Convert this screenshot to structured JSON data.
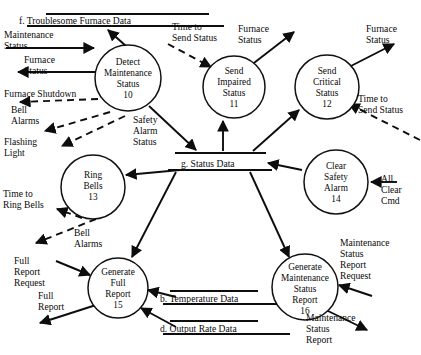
{
  "diagram": {
    "kind": "data-flow-diagram",
    "width": 421,
    "height": 355,
    "background_color": "#ffffff",
    "ink_color": "#0d0d0d",
    "processes": [
      {
        "id": "p10",
        "title_lines": [
          "Detect",
          "Maintenance",
          "Status"
        ],
        "number": "10",
        "cx": 128,
        "cy": 78,
        "r": 33
      },
      {
        "id": "p11",
        "title_lines": [
          "Send",
          "Impaired",
          "Status"
        ],
        "number": "11",
        "cx": 234,
        "cy": 87,
        "r": 31
      },
      {
        "id": "p12",
        "title_lines": [
          "Send",
          "Critical",
          "Status"
        ],
        "number": "12",
        "cx": 327,
        "cy": 87,
        "r": 32
      },
      {
        "id": "p13",
        "title_lines": [
          "Ring",
          "Bells"
        ],
        "number": "13",
        "cx": 93,
        "cy": 187,
        "r": 32
      },
      {
        "id": "p14",
        "title_lines": [
          "Clear",
          "Safety",
          "Alarm"
        ],
        "number": "14",
        "cx": 336,
        "cy": 182,
        "r": 32
      },
      {
        "id": "p15",
        "title_lines": [
          "Generate",
          "Full",
          "Report"
        ],
        "number": "15",
        "cx": 118,
        "cy": 288,
        "r": 30
      },
      {
        "id": "p16",
        "title_lines": [
          "Generate",
          "Maintenance",
          "Status",
          "Report"
        ],
        "number": "16",
        "cx": 305,
        "cy": 287,
        "r": 33
      }
    ],
    "data_stores": [
      {
        "id": "store_f",
        "label": "f.  Troublesome Furnace Data",
        "x1": 46,
        "x2": 209,
        "y_top": 14,
        "y_bottom": 26,
        "text_x": 19,
        "text_y": 24
      },
      {
        "id": "store_g",
        "label": "g.  Status Data",
        "x1": 175,
        "x2": 266,
        "y_top": 153,
        "y_bottom": 170,
        "text_x": 181,
        "text_y": 167
      },
      {
        "id": "store_b",
        "label": "b.  Temperature Data",
        "x1": 163,
        "x2": 268,
        "y_top": 291,
        "y_bottom": 304,
        "text_x": 160,
        "text_y": 302
      },
      {
        "id": "store_d",
        "label": "d.  Output Rate Data",
        "x1": 163,
        "x2": 268,
        "y_top": 321,
        "y_bottom": 334,
        "text_x": 160,
        "text_y": 332
      }
    ],
    "flow_labels": [
      {
        "id": "lbl_maintenance_status_in",
        "lines": [
          "Maintenance",
          "Status"
        ],
        "x": 4,
        "y": 38
      },
      {
        "id": "lbl_furnace_status_out",
        "lines": [
          "Furnace",
          "Status"
        ],
        "x": 24,
        "y": 63
      },
      {
        "id": "lbl_furnace_shutdown",
        "lines": [
          "Furnace Shutdown"
        ],
        "x": 4,
        "y": 97
      },
      {
        "id": "lbl_bell_alarms_left",
        "lines": [
          "Bell",
          "Alarms"
        ],
        "x": 11,
        "y": 110
      },
      {
        "id": "lbl_flashing_light",
        "lines": [
          "Flashing",
          "Light"
        ],
        "x": 4,
        "y": 142
      },
      {
        "id": "lbl_time_to_send_status_11",
        "lines": [
          "Time to",
          "Send Status"
        ],
        "x": 172,
        "y": 30
      },
      {
        "id": "lbl_furnace_status_11",
        "lines": [
          "Furnace",
          "Status"
        ],
        "x": 238,
        "y": 32
      },
      {
        "id": "lbl_furnace_status_12",
        "lines": [
          "Furnace",
          "Status"
        ],
        "x": 366,
        "y": 32
      },
      {
        "id": "lbl_time_to_send_status_12",
        "lines": [
          "Time to",
          "Send Status"
        ],
        "x": 358,
        "y": 102
      },
      {
        "id": "lbl_safety_alarm_status",
        "lines": [
          "Safety",
          "Alarm",
          "Status"
        ],
        "x": 133,
        "y": 120
      },
      {
        "id": "lbl_all_clear_cmd",
        "lines": [
          "All",
          "Clear",
          "Cmd"
        ],
        "x": 381,
        "y": 180
      },
      {
        "id": "lbl_time_to_ring_bells",
        "lines": [
          "Time to",
          "Ring Bells"
        ],
        "x": 3,
        "y": 194
      },
      {
        "id": "lbl_bell_alarms_13",
        "lines": [
          "Bell",
          "Alarms"
        ],
        "x": 74,
        "y": 233
      },
      {
        "id": "lbl_full_report_request",
        "lines": [
          "Full",
          "Report",
          "Request"
        ],
        "x": 14,
        "y": 261
      },
      {
        "id": "lbl_full_report_out",
        "lines": [
          "Full",
          "Report"
        ],
        "x": 38,
        "y": 292
      },
      {
        "id": "lbl_maintenance_status_report_request",
        "lines": [
          "Maintenance",
          "Status",
          "Report",
          "Request"
        ],
        "x": 340,
        "y": 243
      },
      {
        "id": "lbl_maintenance_status_report_out",
        "lines": [
          "Maintenance",
          "Status",
          "Report"
        ],
        "x": 306,
        "y": 318
      }
    ]
  }
}
